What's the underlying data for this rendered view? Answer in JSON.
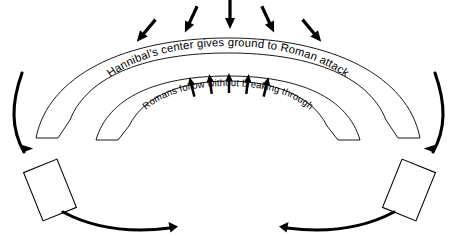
{
  "diagram": {
    "background_color": "#ffffff",
    "line_color": "#000000",
    "width": 457,
    "height": 236
  },
  "labels": {
    "outer_arc_text": "Hannibal's center gives ground to Roman attack",
    "inner_arc_text": "Romans follow without breaking through"
  },
  "formations": [
    {
      "id": "outer-arc",
      "name": "Hannibal's center line"
    },
    {
      "id": "inner-arc",
      "name": "Roman advancing line"
    },
    {
      "id": "left-flank-unit",
      "name": "Left flank unit"
    },
    {
      "id": "right-flank-unit",
      "name": "Right flank unit"
    }
  ],
  "arrows": {
    "roman_attack": {
      "name": "roman-attack-arrows",
      "count": 5,
      "direction": "down",
      "description": "Roman attack pressing onto Hannibal's center"
    },
    "center_resistance": {
      "name": "center-resistance-arrows",
      "count": 5,
      "direction": "up",
      "description": "Carthaginian center holding and giving ground"
    },
    "flank_envelopment": {
      "name": "flank-envelopment-arrows",
      "count": 4,
      "description": "Cavalry sweeping down the flanks and converging at the rear"
    }
  }
}
